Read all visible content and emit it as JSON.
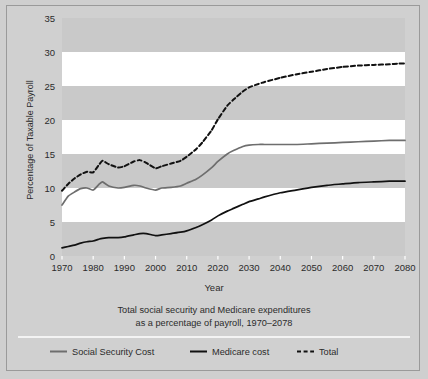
{
  "figure": {
    "background_color": "#cfcfcf",
    "border_color": "#9a9a9a",
    "band_white": "#ffffff",
    "band_gray": "#c9c9c9"
  },
  "axis": {
    "ylabel": "Percentage of Taxable Payroll",
    "xlabel": "Year",
    "yticks": [
      "0",
      "5",
      "10",
      "15",
      "20",
      "25",
      "30",
      "35"
    ],
    "xticks": [
      "1970",
      "1980",
      "1990",
      "2000",
      "2010",
      "2020",
      "2030",
      "2040",
      "2050",
      "2060",
      "2070",
      "2080"
    ]
  },
  "caption": {
    "line1": "Total social security and Medicare expenditures",
    "line2": "as a percentage of payroll, 1970–2078"
  },
  "legend": [
    {
      "label": "Social Security Cost",
      "color": "#6e6e6e",
      "style": "solid"
    },
    {
      "label": "Medicare cost",
      "color": "#111111",
      "style": "solid"
    },
    {
      "label": "Total",
      "color": "#111111",
      "style": "dashed"
    }
  ],
  "chart_data": {
    "type": "line",
    "xlabel": "Year",
    "ylabel": "Percentage of Taxable Payroll",
    "xlim": [
      1970,
      2080
    ],
    "ylim": [
      0,
      35
    ],
    "grid": "horizontal-banded",
    "legend_position": "bottom",
    "x": [
      1970,
      1972,
      1974,
      1976,
      1978,
      1980,
      1982,
      1983,
      1985,
      1988,
      1990,
      1993,
      1995,
      1997,
      2000,
      2002,
      2005,
      2008,
      2010,
      2013,
      2015,
      2018,
      2020,
      2023,
      2025,
      2028,
      2030,
      2033,
      2035,
      2040,
      2045,
      2050,
      2055,
      2060,
      2065,
      2070,
      2075,
      2078,
      2080
    ],
    "series": [
      {
        "name": "Social Security Cost",
        "color": "#6e6e6e",
        "style": "solid",
        "values": [
          7.5,
          8.8,
          9.4,
          9.9,
          10.0,
          9.7,
          10.6,
          10.9,
          10.3,
          10.0,
          10.1,
          10.4,
          10.3,
          10.0,
          9.7,
          10.0,
          10.1,
          10.3,
          10.7,
          11.3,
          11.9,
          13.0,
          13.9,
          15.0,
          15.5,
          16.1,
          16.3,
          16.4,
          16.4,
          16.4,
          16.4,
          16.5,
          16.6,
          16.7,
          16.8,
          16.9,
          17.0,
          17.0,
          17.0
        ]
      },
      {
        "name": "Medicare cost",
        "color": "#111111",
        "style": "solid",
        "values": [
          1.2,
          1.4,
          1.6,
          1.9,
          2.1,
          2.2,
          2.5,
          2.6,
          2.7,
          2.7,
          2.8,
          3.1,
          3.3,
          3.3,
          3.0,
          3.1,
          3.3,
          3.5,
          3.7,
          4.2,
          4.6,
          5.3,
          5.9,
          6.6,
          7.0,
          7.6,
          8.0,
          8.4,
          8.7,
          9.3,
          9.7,
          10.1,
          10.4,
          10.6,
          10.8,
          10.9,
          11.0,
          11.0,
          11.0
        ]
      },
      {
        "name": "Total",
        "color": "#111111",
        "style": "dashed",
        "values": [
          9.6,
          10.6,
          11.4,
          12.0,
          12.4,
          12.3,
          13.5,
          14.0,
          13.5,
          13.0,
          13.2,
          13.9,
          14.1,
          13.7,
          12.9,
          13.2,
          13.6,
          14.0,
          14.6,
          15.7,
          16.7,
          18.5,
          20.1,
          22.1,
          23.0,
          24.2,
          24.8,
          25.3,
          25.6,
          26.2,
          26.7,
          27.1,
          27.5,
          27.8,
          28.0,
          28.1,
          28.2,
          28.3,
          28.3
        ]
      }
    ]
  }
}
